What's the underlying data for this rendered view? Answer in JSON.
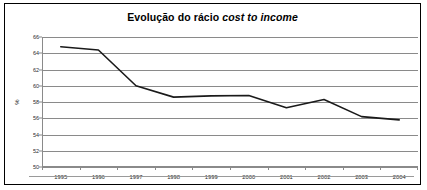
{
  "chart_data": {
    "type": "line",
    "title": "Evolução do rácio cost to income",
    "title_plain": "Evolução do rácio ",
    "title_italic": "cost to income",
    "xlabel": "",
    "ylabel": "%",
    "categories": [
      "1995",
      "1996",
      "1997",
      "1998",
      "1999",
      "2000",
      "2001",
      "2002",
      "2003",
      "2004"
    ],
    "values": [
      64.8,
      64.4,
      60.0,
      58.6,
      58.75,
      58.8,
      57.3,
      58.3,
      56.2,
      55.8
    ],
    "series": [
      {
        "name": "cost to income",
        "values": [
          64.8,
          64.4,
          60.0,
          58.6,
          58.75,
          58.8,
          57.3,
          58.3,
          56.2,
          55.8
        ]
      }
    ],
    "ylim": [
      50,
      66
    ],
    "ytick_step": 2,
    "yticks": [
      66,
      64,
      62,
      60,
      58,
      56,
      54,
      52,
      50
    ],
    "ytick_labels": [
      "66",
      "64",
      "62",
      "60",
      "58",
      "56",
      "54",
      "52",
      "50"
    ],
    "grid": true,
    "legend": false,
    "line_color": "#1a1a1a",
    "grid_color": "#8a8a8a",
    "border_color": "#000000",
    "background_color": "#ffffff"
  }
}
